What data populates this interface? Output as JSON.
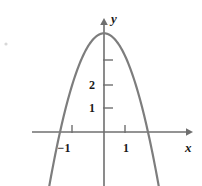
{
  "figure": {
    "kind": "cartesian-plot",
    "width": 202,
    "height": 186,
    "background_color": "#ffffff",
    "axis_color": "#6f6f6f",
    "curve_color": "#7d7d7d",
    "label_color": "#1a1a1a"
  },
  "axes": {
    "x_label": "x",
    "y_label": "y",
    "origin_px": {
      "x": 104,
      "y": 132
    },
    "x_unit_px": 26.5,
    "y_unit_px": 23.5,
    "x_axis_start_px": 32,
    "x_axis_end_px": 190,
    "y_axis_top_px": 20,
    "y_axis_bottom_px": 186,
    "x_ticks": [
      {
        "value": -1,
        "label": "−1",
        "px": 72
      },
      {
        "value": 1,
        "label": "1",
        "px": 125
      }
    ],
    "y_ticks": [
      {
        "value": 1,
        "label": "1",
        "px": 108
      },
      {
        "value": 2,
        "label": "2",
        "px": 85
      },
      {
        "value": 3,
        "label": "",
        "px": 60
      }
    ]
  },
  "chart_data": {
    "type": "line",
    "title": "",
    "xlabel": "x",
    "ylabel": "y",
    "xlim": [
      -2.7,
      3.2
    ],
    "ylim": [
      -2.3,
      4.8
    ],
    "grid": false,
    "legend": "none",
    "series": [
      {
        "name": "parabola",
        "shape": "downward-opening parabola",
        "equation": "y = 4.2 − 1.52 x²",
        "vertex": {
          "x": 0,
          "y": 4.2
        },
        "roots": [
          -1.66,
          1.66
        ],
        "x": [
          -2.1,
          -1.9,
          -1.7,
          -1.5,
          -1.3,
          -1.1,
          -0.9,
          -0.7,
          -0.5,
          -0.3,
          -0.1,
          0.1,
          0.3,
          0.5,
          0.7,
          0.9,
          1.1,
          1.3,
          1.5,
          1.7,
          1.9,
          2.1
        ],
        "y": [
          -2.5,
          -1.29,
          -0.19,
          0.78,
          1.63,
          2.36,
          2.97,
          3.45,
          3.82,
          4.06,
          4.18,
          4.18,
          4.06,
          3.82,
          3.45,
          2.97,
          2.36,
          1.63,
          0.78,
          -0.19,
          -1.29,
          -2.5
        ]
      }
    ]
  },
  "tick_labels": {
    "x_neg_one": "−1",
    "x_pos_one": "1",
    "y_one": "1",
    "y_two": "2"
  }
}
